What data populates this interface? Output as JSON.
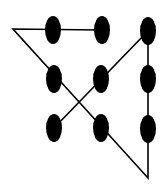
{
  "diagram": {
    "title": "",
    "type": "nine-dot puzzle solution",
    "colors": {
      "background": "#ffffff",
      "ink": "#000000"
    },
    "dots": [
      {
        "id": "r1c1",
        "cx": 53,
        "cy": 30
      },
      {
        "id": "r1c2",
        "cx": 102,
        "cy": 30
      },
      {
        "id": "r1c3",
        "cx": 148,
        "cy": 31
      },
      {
        "id": "r2c1",
        "cx": 54,
        "cy": 79
      },
      {
        "id": "r2c2",
        "cx": 101,
        "cy": 79
      },
      {
        "id": "r2c3",
        "cx": 148,
        "cy": 79
      },
      {
        "id": "r3c1",
        "cx": 54,
        "cy": 128
      },
      {
        "id": "r3c2",
        "cx": 101,
        "cy": 128
      },
      {
        "id": "r3c3",
        "cx": 148,
        "cy": 129
      }
    ],
    "dot_rx": 8,
    "dot_ry": 14,
    "path": [
      {
        "x": 102,
        "y": 30
      },
      {
        "x": 13,
        "y": 29
      },
      {
        "x": 148,
        "y": 178
      },
      {
        "x": 148,
        "y": 31
      },
      {
        "x": 54,
        "y": 128
      }
    ]
  }
}
